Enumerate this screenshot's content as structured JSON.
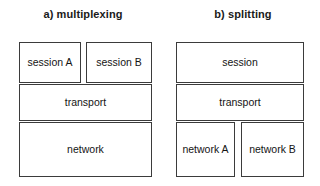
{
  "figure": {
    "title": "",
    "background_color": "#ffffff",
    "line_color": "#3b3b3b",
    "text_color": "#141414"
  },
  "panels": [
    {
      "id": "multiplexing",
      "title": "a) multiplexing",
      "boxes": [
        {
          "id": "session-a",
          "label": "session A"
        },
        {
          "id": "session-b",
          "label": "session B"
        },
        {
          "id": "transport",
          "label": "transport"
        },
        {
          "id": "network",
          "label": "network"
        }
      ]
    },
    {
      "id": "splitting",
      "title": "b) splitting",
      "boxes": [
        {
          "id": "session",
          "label": "session"
        },
        {
          "id": "transport",
          "label": "transport"
        },
        {
          "id": "network-a",
          "label": "network A"
        },
        {
          "id": "network-b",
          "label": "network B"
        }
      ]
    }
  ]
}
